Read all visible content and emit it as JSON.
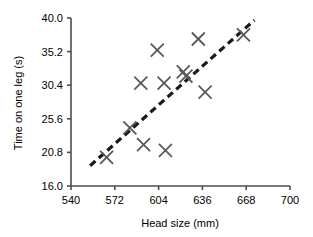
{
  "chart_data": {
    "type": "scatter",
    "title": "",
    "xlabel": "Head size (mm)",
    "ylabel": "Time on one leg (s)",
    "xlim": [
      540,
      700
    ],
    "ylim": [
      16.0,
      40.0
    ],
    "xticks": [
      540,
      572,
      604,
      636,
      668,
      700
    ],
    "xtick_labels": [
      "540",
      "572",
      "604",
      "636",
      "668",
      "700"
    ],
    "yticks": [
      16.0,
      20.8,
      25.6,
      30.4,
      35.2,
      40.0
    ],
    "ytick_labels": [
      "16.0",
      "20.8",
      "25.6",
      "30.4",
      "35.2",
      "40.0"
    ],
    "grid": false,
    "legend": "none",
    "marker": "x",
    "marker_color": "#595959",
    "series": [
      {
        "name": "Observations",
        "x": [
          566,
          583,
          593,
          609,
          591,
          608,
          603,
          622,
          624,
          633,
          638,
          666
        ],
        "y": [
          20.1,
          24.3,
          21.9,
          21.1,
          30.7,
          30.7,
          35.4,
          32.3,
          31.7,
          37.0,
          29.4,
          37.6
        ]
      }
    ],
    "trendline": {
      "style": "dashed",
      "color": "#1a1a1a",
      "x_start": 554,
      "y_start": 18.9,
      "x_end": 674,
      "y_end": 39.7
    }
  },
  "axis": {
    "line_color": "#4d4d4d"
  }
}
